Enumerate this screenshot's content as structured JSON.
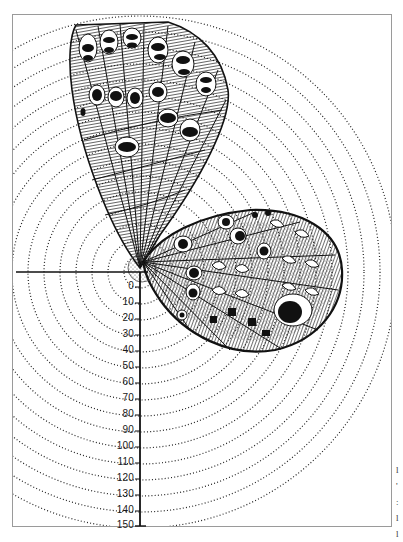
{
  "figure": {
    "parts": [
      "forewing",
      "hindwing",
      "wing-base",
      "radial-scale",
      "concentric-arcs"
    ],
    "colors": {
      "ink": "#111111",
      "paper": "#ffffff",
      "frame": "#9a9a9a"
    }
  },
  "scale": {
    "orientation": "vertical",
    "ticks": [
      {
        "value": 0,
        "label": "0"
      },
      {
        "value": 10,
        "label": "10"
      },
      {
        "value": 20,
        "label": "20"
      },
      {
        "value": 30,
        "label": "30"
      },
      {
        "value": 40,
        "label": "40"
      },
      {
        "value": 50,
        "label": "50"
      },
      {
        "value": 60,
        "label": "60"
      },
      {
        "value": 70,
        "label": "70"
      },
      {
        "value": 80,
        "label": "80"
      },
      {
        "value": 90,
        "label": "90"
      },
      {
        "value": 100,
        "label": "100"
      },
      {
        "value": 110,
        "label": "110"
      },
      {
        "value": 120,
        "label": "120"
      },
      {
        "value": 130,
        "label": "130"
      },
      {
        "value": 140,
        "label": "140"
      },
      {
        "value": 150,
        "label": "150"
      }
    ]
  },
  "margin_fragments": [
    "l",
    "'",
    ":",
    "l",
    "l"
  ]
}
